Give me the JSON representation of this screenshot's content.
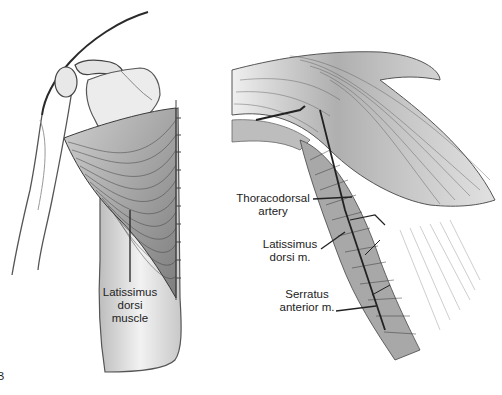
{
  "figure": {
    "panel_left": {
      "label_lines": [
        "Latissimus",
        "dorsi",
        "muscle"
      ]
    },
    "panel_right": {
      "labels": [
        {
          "lines": [
            "Thoracodorsal",
            "artery"
          ]
        },
        {
          "lines": [
            "Latissimus",
            "dorsi m."
          ]
        },
        {
          "lines": [
            "Serratus",
            "anterior m."
          ]
        }
      ]
    },
    "panel_letter": "B",
    "colors": {
      "ink": "#2a2a2a",
      "shade": "#8a8a8a",
      "light": "#d8d8d8",
      "background": "#ffffff"
    }
  }
}
